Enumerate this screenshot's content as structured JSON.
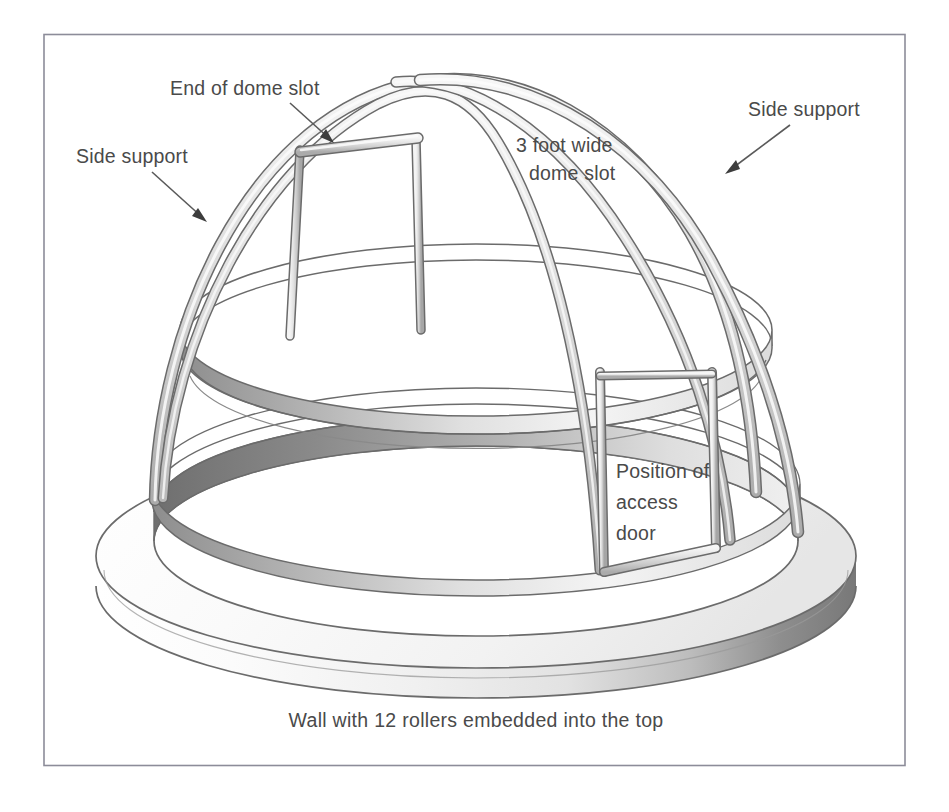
{
  "figure": {
    "title_alt": "Observatory dome frame on circular wall",
    "border_color": "#8c8c99",
    "background_color": "#ffffff",
    "line_color": "#5e5e5e",
    "text_color": "#4a4a4a",
    "fill_light": "#f2f2f2",
    "fill_mid": "#c9c9c9",
    "fill_dark": "#8f8f8f"
  },
  "labels": {
    "end_of_dome_slot": "End of dome slot",
    "side_support_left": "Side support",
    "side_support_right": "Side support",
    "dome_slot_line1": "3 foot wide",
    "dome_slot_line2": "dome slot",
    "access_door_line1": "Position of",
    "access_door_line2": "access",
    "access_door_line3": "door"
  },
  "caption": {
    "wall_note": "Wall with 12 rollers embedded into the top",
    "roller_count": "12"
  },
  "parts": {
    "dome_rib": "dome-rib",
    "side_support": "side-support",
    "dome_slot_rail": "dome-slot-rail",
    "slot_end_crossbar": "slot-end-crossbar",
    "equator_ring": "equator-ring",
    "base_ring": "base-ring",
    "wall_cylinder": "wall-cylinder",
    "access_door_frame": "access-door-frame"
  }
}
